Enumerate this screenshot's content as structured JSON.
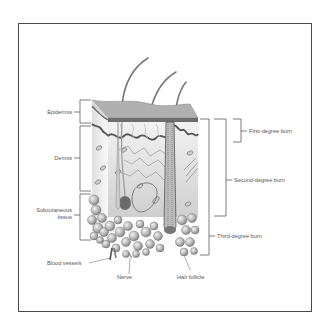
{
  "figure": {
    "layers": [
      {
        "label": "Epidermis"
      },
      {
        "label": "Dermis"
      },
      {
        "label": "Subcutaneous tissue",
        "line1": "Subcutaneous",
        "line2": "tissue"
      }
    ],
    "burns": [
      {
        "label": "First-degree burn"
      },
      {
        "label": "Second-degree burn"
      },
      {
        "label": "Third-degree burn"
      }
    ],
    "structures": [
      {
        "label": "Blood vessels"
      },
      {
        "label": "Nerve"
      },
      {
        "label": "Hair follicle"
      }
    ],
    "colors": {
      "frame": "#4a4a4a",
      "label_text": "#555555",
      "epidermis_top": "#a9a9a9",
      "dermis": "#d6d6d6",
      "fat_cells": "#b8b8b8",
      "bracket": "#5a5a5a"
    }
  }
}
